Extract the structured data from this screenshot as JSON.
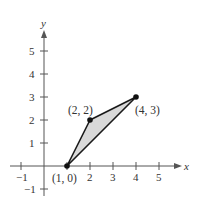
{
  "figure": {
    "axes": {
      "x_label": "x",
      "y_label": "y",
      "x_ticks": [
        {
          "value": -1,
          "label": "−1"
        },
        {
          "value": 2,
          "label": "2"
        },
        {
          "value": 3,
          "label": "3"
        },
        {
          "value": 4,
          "label": "4"
        },
        {
          "value": 5,
          "label": "5"
        }
      ],
      "y_ticks": [
        {
          "value": 5,
          "label": "5"
        },
        {
          "value": 4,
          "label": "4"
        },
        {
          "value": 3,
          "label": "3"
        },
        {
          "value": 2,
          "label": "2"
        },
        {
          "value": 1,
          "label": "1"
        },
        {
          "value": -1,
          "label": "−1"
        }
      ]
    },
    "polygon": {
      "fill_color": "#d9d9d9",
      "stroke_color": "#1a1a1a",
      "vertices": [
        {
          "x": 1,
          "y": 0,
          "label": "(1, 0)"
        },
        {
          "x": 2,
          "y": 2,
          "label": "(2, 2)"
        },
        {
          "x": 4,
          "y": 3,
          "label": "(4, 3)"
        }
      ]
    }
  }
}
